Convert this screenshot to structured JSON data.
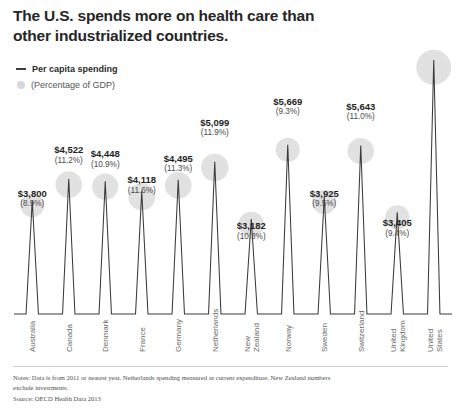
{
  "title": "The U.S. spends more on health care than other industrialized countries.",
  "legend": {
    "spending_label": "Per capita spending",
    "gdp_label": "(Percentage of GDP)"
  },
  "footer": {
    "notes": "Notes: Data is from 2011 or nearest year. Netherlands spending measured as current expenditure. New Zealand numbers exclude investments.",
    "source": "Source: OECD Health Data 2013"
  },
  "colors": {
    "line": "#3a3a3a",
    "bubble": "#dcdcdc",
    "text": "#1f1f1f",
    "rule": "#cfcfcf"
  },
  "chart_data": {
    "type": "line",
    "title": "The U.S. spends more on health care than other industrialized countries.",
    "xlabel": "",
    "ylabel": "Per capita spending",
    "ylim": [
      0,
      8508
    ],
    "grid": false,
    "legend_position": "top-left",
    "categories": [
      "Australia",
      "Canada",
      "Denmark",
      "France",
      "Germany",
      "Netherlands",
      "New Zealand",
      "Norway",
      "Sweden",
      "Switzerland",
      "United Kingdom",
      "United States"
    ],
    "category_lines": [
      [
        "Australia"
      ],
      [
        "Canada"
      ],
      [
        "Denmark"
      ],
      [
        "France"
      ],
      [
        "Germany"
      ],
      [
        "Netherlands"
      ],
      [
        "New",
        "Zealand"
      ],
      [
        "Norway"
      ],
      [
        "Sweden"
      ],
      [
        "Switzerland"
      ],
      [
        "United",
        "Kingdom"
      ],
      [
        "United",
        "States"
      ]
    ],
    "series": [
      {
        "name": "Per capita spending",
        "unit": "USD",
        "values": [
          3800,
          4522,
          4448,
          4118,
          4495,
          5099,
          3182,
          5669,
          3925,
          5643,
          3405,
          8508
        ],
        "labels": [
          "$3,800",
          "$4,522",
          "$4,448",
          "$4,118",
          "$4,495",
          "$5,099",
          "$3,182",
          "$5,669",
          "$3,925",
          "$5,643",
          "$3,405",
          "$8,508"
        ]
      },
      {
        "name": "Percentage of GDP",
        "unit": "%",
        "values": [
          8.9,
          11.2,
          10.9,
          11.6,
          11.3,
          11.9,
          10.3,
          9.3,
          9.5,
          11.0,
          9.4,
          17.7
        ],
        "labels": [
          "(8.9%)",
          "(11.2%)",
          "(10.9%)",
          "(11.6%)",
          "(11.3%)",
          "(11.9%)",
          "(10.3%)",
          "(9.3%)",
          "(9.5%)",
          "(11.0%)",
          "(9.4%)",
          "(17.7%)"
        ]
      }
    ]
  }
}
